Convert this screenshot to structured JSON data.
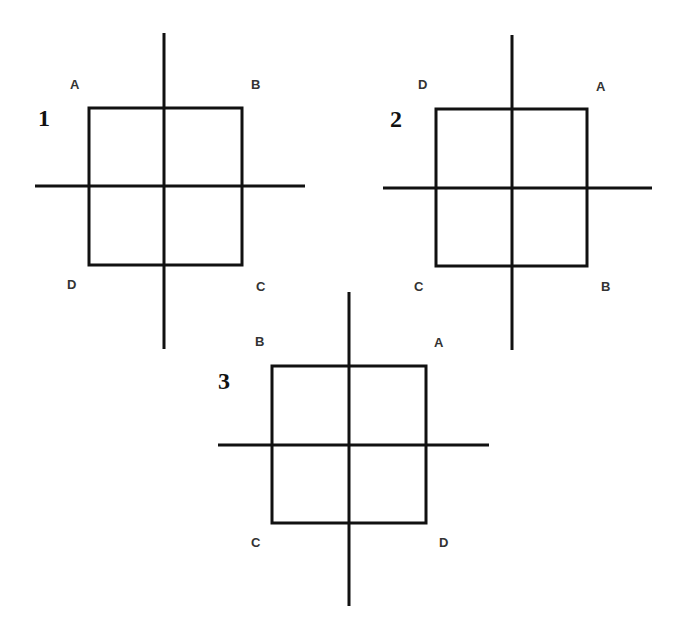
{
  "diagrams": [
    {
      "number": "1",
      "square": {
        "x": 89,
        "y": 108,
        "w": 153,
        "h": 157
      },
      "vline": {
        "x": 164,
        "y1": 33,
        "y2": 349
      },
      "hline": {
        "y": 186,
        "x1": 35,
        "x2": 305
      },
      "num_pos": {
        "x": 38,
        "y": 126
      },
      "labels": [
        {
          "text": "A",
          "x": 70,
          "y": 89
        },
        {
          "text": "B",
          "x": 251,
          "y": 89
        },
        {
          "text": "D",
          "x": 67,
          "y": 289
        },
        {
          "text": "C",
          "x": 256,
          "y": 291
        }
      ]
    },
    {
      "number": "2",
      "square": {
        "x": 436,
        "y": 109,
        "w": 151,
        "h": 157
      },
      "vline": {
        "x": 512,
        "y1": 35,
        "y2": 350
      },
      "hline": {
        "y": 188,
        "x1": 383,
        "x2": 652
      },
      "num_pos": {
        "x": 390,
        "y": 127
      },
      "labels": [
        {
          "text": "D",
          "x": 418,
          "y": 89
        },
        {
          "text": "A",
          "x": 596,
          "y": 91
        },
        {
          "text": "C",
          "x": 414,
          "y": 291
        },
        {
          "text": "B",
          "x": 601,
          "y": 291
        }
      ]
    },
    {
      "number": "3",
      "square": {
        "x": 272,
        "y": 366,
        "w": 154,
        "h": 157
      },
      "vline": {
        "x": 349,
        "y1": 292,
        "y2": 606
      },
      "hline": {
        "y": 445,
        "x1": 218,
        "x2": 489
      },
      "num_pos": {
        "x": 218,
        "y": 389
      },
      "labels": [
        {
          "text": "B",
          "x": 255,
          "y": 346
        },
        {
          "text": "A",
          "x": 434,
          "y": 347
        },
        {
          "text": "C",
          "x": 251,
          "y": 547
        },
        {
          "text": "D",
          "x": 439,
          "y": 547
        }
      ]
    }
  ]
}
